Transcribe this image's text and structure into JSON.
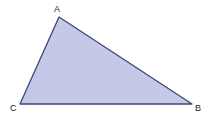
{
  "diagram": {
    "type": "triangle",
    "fill_color": "#c5c9e8",
    "stroke_color": "#3f4672",
    "vertices": [
      {
        "label": "A",
        "x": 59,
        "y": 17,
        "label_x": 54,
        "label_y": 12
      },
      {
        "label": "B",
        "x": 192,
        "y": 104,
        "label_x": 195,
        "label_y": 111
      },
      {
        "label": "C",
        "x": 20,
        "y": 104,
        "label_x": 10,
        "label_y": 111
      }
    ]
  }
}
